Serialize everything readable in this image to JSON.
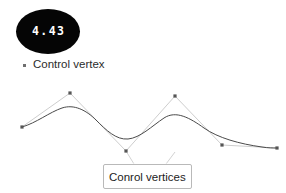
{
  "badge": {
    "value": "4.43",
    "shape": "ellipse",
    "background_color": "#050505",
    "text_color": "#ffffff"
  },
  "legend": {
    "marker_icon": "square-dot-icon",
    "marker_color": "#6f6f6f",
    "label": "Control vertex"
  },
  "tooltip": {
    "label": "Conrol vertices",
    "border_color": "#b9b9b9",
    "background_color": "#ffffff",
    "text_color": "#1c1c1c"
  },
  "chart_data": {
    "type": "line",
    "title": "",
    "xlabel": "",
    "ylabel": "",
    "grid": false,
    "legend_position": "top-left",
    "xlim": [
      0,
      286
    ],
    "ylim": [
      193,
      0
    ],
    "series": [
      {
        "name": "Control vertex",
        "role": "control-polygon",
        "marker": "square",
        "marker_color": "#555555",
        "line_color": "#c0c0c0",
        "x": [
          22,
          70,
          126,
          175,
          222,
          277
        ],
        "y": [
          127,
          93,
          151,
          96,
          145,
          148
        ]
      },
      {
        "name": "Spline curve",
        "role": "smooth-curve",
        "marker": "none",
        "line_color": "#4a4a4a",
        "path": "M22,127 C36,123 50,112 62,108 C74,104 86,110 96,120 C106,130 116,140 128,139 C140,138 152,126 164,118 C176,110 190,118 204,128 C218,138 240,144 262,147 C268,148 273,148 277,148"
      }
    ],
    "annotations": [
      {
        "text": "4.43",
        "type": "value-badge",
        "x": 48,
        "y": 31
      },
      {
        "text": "Conrol vertices",
        "type": "callout",
        "x": 146,
        "y": 173
      }
    ]
  }
}
